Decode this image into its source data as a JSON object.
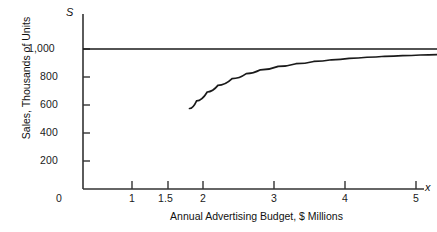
{
  "chart_data": {
    "type": "line",
    "title": "",
    "xlabel": "Annual Advertising Budget, $ Millions",
    "ylabel": "Sales, Thousands of Units",
    "x_axis_symbol": "x",
    "y_axis_symbol": "S",
    "xlim": [
      0,
      5.2
    ],
    "ylim": [
      0,
      1080
    ],
    "grid": false,
    "legend": "none",
    "x_ticks": [
      1,
      1.5,
      2,
      3,
      4,
      5
    ],
    "x_tick_labels": [
      "1",
      "1.5",
      "2",
      "3",
      "4",
      "5"
    ],
    "y_ticks": [
      0,
      200,
      400,
      600,
      800,
      1000
    ],
    "y_tick_labels": [
      "0",
      "200",
      "400",
      "600",
      "800",
      "1,000"
    ],
    "series": [
      {
        "name": "sales-response-curve",
        "x": [
          1.5,
          1.6,
          1.75,
          1.9,
          2.1,
          2.3,
          2.5,
          2.75,
          3.0,
          3.25,
          3.5,
          3.75,
          4.0,
          4.25,
          4.5,
          4.75,
          5.0
        ],
        "values": [
          575,
          630,
          693,
          740,
          788,
          824,
          851,
          876,
          895,
          911,
          923,
          933,
          941,
          948,
          953,
          957,
          960
        ]
      },
      {
        "name": "asymptote-line",
        "x": [
          0,
          5.2
        ],
        "values": [
          1000,
          1000
        ]
      }
    ],
    "annotations": [
      {
        "name": "saturation-asymptote",
        "value": 1000,
        "label": "1,000"
      },
      {
        "name": "curve-start",
        "x": 1.5,
        "value": 575
      },
      {
        "name": "curve-end",
        "x": 5.0,
        "value": 960
      }
    ],
    "colors": {
      "axis": "#333333",
      "curve": "#1a1a1a",
      "asymptote": "#1a1a1a",
      "background": "#ffffff",
      "text": "#111111"
    }
  }
}
